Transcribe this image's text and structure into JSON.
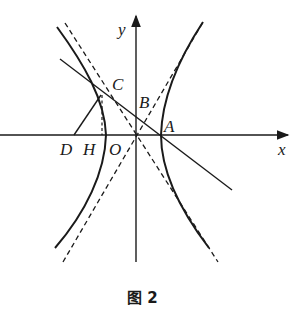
{
  "figure": {
    "caption": "图 2",
    "colors": {
      "ink": "#1a1a1a",
      "background": "#ffffff"
    }
  },
  "axes": {
    "x_label": "x",
    "y_label": "y",
    "origin_label": "O"
  },
  "points": {
    "A": "A",
    "B": "B",
    "C": "C",
    "D": "D",
    "H": "H",
    "O": "O"
  },
  "elements": [
    {
      "name": "hyperbola-right-branch",
      "style": "solid"
    },
    {
      "name": "hyperbola-left-branch",
      "style": "solid"
    },
    {
      "name": "asymptote-positive-slope",
      "style": "dashed"
    },
    {
      "name": "asymptote-negative-slope",
      "style": "dashed"
    },
    {
      "name": "line-through-C-B-A",
      "style": "solid"
    },
    {
      "name": "segment-DC",
      "style": "solid"
    },
    {
      "name": "perpendicular-CH",
      "style": "dashed"
    }
  ]
}
